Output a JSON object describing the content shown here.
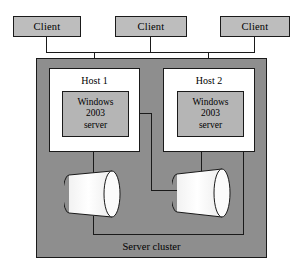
{
  "diagram": {
    "type": "network-architecture-diagram",
    "colors": {
      "client_fill": "#bdbdbd",
      "cluster_fill": "#8e8e8e",
      "host_fill": "#ffffff",
      "os_box_fill": "#b5b5b5",
      "storage_fill": "#fbfbfb",
      "stroke": "#1a1a1a",
      "background": "#ffffff"
    },
    "clients": [
      {
        "label": "Client"
      },
      {
        "label": "Client"
      },
      {
        "label": "Client"
      }
    ],
    "cluster": {
      "label": "Server cluster",
      "hosts": [
        {
          "label": "Host 1",
          "os_line1": "Windows",
          "os_line2": "2003",
          "os_line3": "server"
        },
        {
          "label": "Host 2",
          "os_line1": "Windows",
          "os_line2": "2003",
          "os_line3": "server"
        }
      ],
      "storage": [
        {
          "name": "shared-disk-left"
        },
        {
          "name": "shared-disk-right"
        }
      ]
    }
  }
}
